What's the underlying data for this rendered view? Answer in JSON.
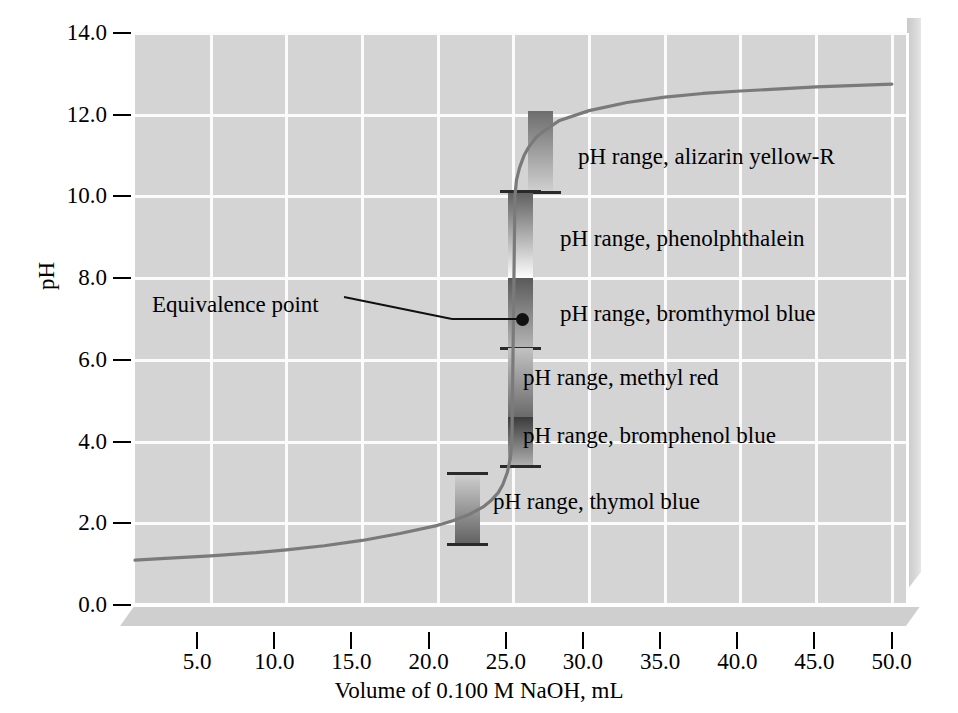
{
  "chart_data": {
    "type": "line",
    "title": "",
    "xlabel": "Volume of 0.100 M NaOH, mL",
    "ylabel": "pH",
    "xlim": [
      0.0,
      51.0
    ],
    "ylim": [
      0.0,
      14.0
    ],
    "grid": true,
    "legend": "none",
    "xticks": [
      "5.0",
      "10.0",
      "15.0",
      "20.0",
      "25.0",
      "30.0",
      "35.0",
      "40.0",
      "45.0",
      "50.0"
    ],
    "xtick_values": [
      5.0,
      10.0,
      15.0,
      20.0,
      25.0,
      30.0,
      35.0,
      40.0,
      45.0,
      50.0
    ],
    "yticks": [
      "0.0",
      "2.0",
      "4.0",
      "6.0",
      "8.0",
      "10.0",
      "12.0",
      "14.0"
    ],
    "ytick_values": [
      0.0,
      2.0,
      4.0,
      6.0,
      8.0,
      10.0,
      12.0,
      14.0
    ],
    "series": [
      {
        "name": "Titration curve",
        "color": "#7a7a7a",
        "x": [
          0.0,
          2.0,
          5.0,
          8.0,
          10.0,
          12.5,
          15.0,
          17.5,
          20.0,
          21.0,
          22.0,
          23.0,
          23.5,
          24.0,
          24.3,
          24.6,
          24.8,
          24.9,
          25.0,
          25.1,
          25.2,
          25.4,
          25.7,
          26.0,
          26.5,
          27.0,
          28.0,
          30.0,
          32.5,
          35.0,
          37.5,
          40.0,
          45.0,
          50.0
        ],
        "y": [
          1.1,
          1.14,
          1.2,
          1.28,
          1.35,
          1.45,
          1.58,
          1.75,
          1.95,
          2.06,
          2.2,
          2.4,
          2.55,
          2.75,
          2.95,
          3.25,
          3.6,
          4.0,
          7.0,
          10.0,
          10.4,
          10.7,
          11.0,
          11.2,
          11.45,
          11.6,
          11.85,
          12.1,
          12.3,
          12.43,
          12.52,
          12.58,
          12.68,
          12.75
        ]
      }
    ],
    "annotations": [
      {
        "name": "equivalence-point",
        "text": "Equivalence point",
        "x": 25.0,
        "y": 7.0
      }
    ],
    "indicator_bands": [
      {
        "name": "alizarin-yellow-r",
        "label": "pH range, alizarin yellow-R",
        "ph_low": 10.1,
        "ph_high": 12.1,
        "offset": "right",
        "gradient_top": "#6d6d6d",
        "gradient_bottom": "#d0d0d0",
        "cap_bottom": true,
        "cap_top": false
      },
      {
        "name": "phenolphthalein",
        "label": "pH range, phenolphthalein",
        "ph_low": 8.0,
        "ph_high": 10.1,
        "offset": "center",
        "gradient_top": "#5f5f5f",
        "gradient_bottom": "#fdfdfd",
        "cap_bottom": false,
        "cap_top": true
      },
      {
        "name": "bromthymol-blue",
        "label": "pH range, bromthymol blue",
        "ph_low": 6.3,
        "ph_high": 8.0,
        "offset": "center",
        "gradient_top": "#5a5a5a",
        "gradient_bottom": "#b5b5b5",
        "cap_bottom": true,
        "cap_top": false
      },
      {
        "name": "methyl-red",
        "label": "pH range, methyl red",
        "ph_low": 4.6,
        "ph_high": 6.3,
        "offset": "center",
        "gradient_top": "#c2c2c2",
        "gradient_bottom": "#6a6a6a",
        "cap_bottom": false,
        "cap_top": false
      },
      {
        "name": "bromphenol-blue",
        "label": "pH range, bromphenol blue",
        "ph_low": 3.4,
        "ph_high": 4.6,
        "offset": "center",
        "gradient_top": "#3b3b3b",
        "gradient_bottom": "#b0b0b0",
        "cap_bottom": true,
        "cap_top": false
      },
      {
        "name": "thymol-blue",
        "label": "pH range, thymol blue",
        "ph_low": 1.5,
        "ph_high": 3.2,
        "offset": "left",
        "gradient_top": "#cfcfcf",
        "gradient_bottom": "#616161",
        "cap_bottom": true,
        "cap_top": true
      }
    ]
  },
  "axes": {
    "y_title": "pH",
    "x_title": "Volume of 0.100 M NaOH, mL",
    "y_labels": [
      "14.0",
      "12.0",
      "10.0",
      "8.0",
      "6.0",
      "4.0",
      "2.0",
      "0.0"
    ],
    "x_labels": [
      "5.0",
      "10.0",
      "15.0",
      "20.0",
      "25.0",
      "30.0",
      "35.0",
      "40.0",
      "45.0",
      "50.0"
    ]
  },
  "annotation": {
    "equivalence_text": "Equivalence point"
  },
  "indicators": {
    "alizarin_yellow_r": "pH range, alizarin yellow-R",
    "phenolphthalein": "pH range, phenolphthalein",
    "bromthymol_blue": "pH range, bromthymol blue",
    "methyl_red": "pH range, methyl red",
    "bromphenol_blue": "pH range, bromphenol blue",
    "thymol_blue": "pH range, thymol blue"
  },
  "colors": {
    "plot_background": "#d4d4d4",
    "gridline": "#fbfbfb",
    "curve": "#7a7a7a",
    "text": "#000000"
  }
}
